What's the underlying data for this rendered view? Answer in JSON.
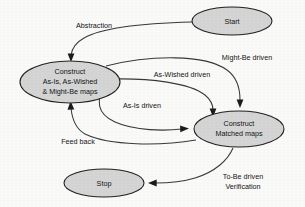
{
  "diagram": {
    "background_color": "#fbfbfa",
    "node_fill_color": "#d6d6d6",
    "node_stroke_color": "#222222",
    "edge_color": "#3a3a3a",
    "text_color": "#141414",
    "nodes": [
      {
        "id": "start",
        "shape": "ellipse",
        "lines": [
          "Start"
        ],
        "line1": "Start"
      },
      {
        "id": "construct-maps",
        "shape": "ellipse",
        "lines": [
          "Construct",
          "As-Is, As-Wished",
          "& Might-Be maps"
        ],
        "line1": "Construct",
        "line2": "As-Is, As-Wished",
        "line3": "& Might-Be maps"
      },
      {
        "id": "construct-matched-maps",
        "shape": "ellipse",
        "lines": [
          "Construct",
          "Matched maps"
        ],
        "line1": "Construct",
        "line2": "Matched maps"
      },
      {
        "id": "stop",
        "shape": "ellipse",
        "lines": [
          "Stop"
        ],
        "line1": "Stop"
      }
    ],
    "edges": [
      {
        "id": "abstraction",
        "from": "start",
        "to": "construct-maps",
        "label": "Abstraction",
        "line1": "Abstraction"
      },
      {
        "id": "might-be-driven",
        "from": "construct-maps",
        "to": "construct-matched-maps",
        "label": "Might-Be driven",
        "line1": "Might-Be driven"
      },
      {
        "id": "as-wished-driven",
        "from": "construct-maps",
        "to": "construct-matched-maps",
        "label": "As-Wished driven",
        "line1": "As-Wished driven"
      },
      {
        "id": "as-is-driven",
        "from": "construct-maps",
        "to": "construct-matched-maps",
        "label": "As-Is driven",
        "line1": "As-Is driven"
      },
      {
        "id": "feed-back",
        "from": "construct-matched-maps",
        "to": "construct-maps",
        "label": "Feed back",
        "line1": "Feed back"
      },
      {
        "id": "to-be-driven-verification",
        "from": "construct-matched-maps",
        "to": "stop",
        "label": "To-Be driven Verification",
        "line1": "To-Be driven",
        "line2": "Verification"
      }
    ]
  }
}
